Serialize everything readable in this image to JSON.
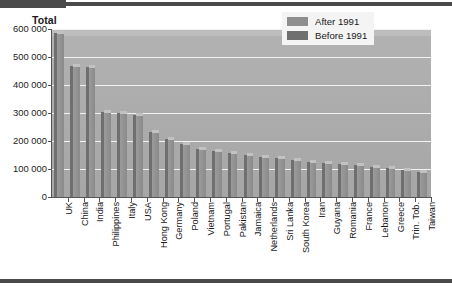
{
  "chart_data": {
    "type": "bar",
    "title": "",
    "ylabel": "Total",
    "xlabel": "",
    "ylim": [
      0,
      600000
    ],
    "ytick_labels": [
      "600 000",
      "500 000",
      "400 000",
      "300 000",
      "200 000",
      "100 000",
      "0"
    ],
    "ytick_values": [
      600000,
      500000,
      400000,
      300000,
      200000,
      100000,
      0
    ],
    "grid": true,
    "legend_position": "top-right",
    "legend": [
      {
        "label": "After 1991",
        "color": "#8e8e8e"
      },
      {
        "label": "Before 1991",
        "color": "#6f6f6f"
      }
    ],
    "categories": [
      "UK",
      "China",
      "India",
      "Philippines",
      "Italy",
      "USA",
      "Hong Kong",
      "Germany",
      "Poland",
      "Vietnam",
      "Portugal",
      "Pakistan",
      "Jamaica",
      "Netherlands",
      "Sri Lanka",
      "South Korea",
      "Iran",
      "Guyana",
      "Romania",
      "France",
      "Lebanon",
      "Greece",
      "Trin. Tob.",
      "Taiwan"
    ],
    "values": [
      592000,
      475000,
      470000,
      310000,
      308000,
      300000,
      240000,
      215000,
      195000,
      180000,
      172000,
      165000,
      158000,
      150000,
      145000,
      138000,
      132000,
      128000,
      124000,
      120000,
      115000,
      110000,
      102000,
      95000
    ]
  },
  "plot": {
    "background_color": "#a9a9a9",
    "gridline_color": "#f2f2f2",
    "bar_front_color": "#8e8e8e",
    "bar_side_color": "#6f6f6f",
    "bar_top_color": "#c2c2c2"
  }
}
